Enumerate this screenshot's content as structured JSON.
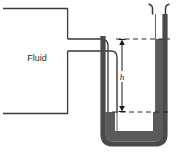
{
  "figure": {
    "type": "diagram",
    "width": 180,
    "height": 152,
    "background_color": "#ffffff"
  },
  "labels": {
    "fluid": "Fluid",
    "height": "h"
  },
  "colors": {
    "outline": "#3a3a3a",
    "manometer_wall": "#4a4a4a",
    "manometer_liquid": "#5a5a5a",
    "dashed_line": "#2b2b2b",
    "text": "#2b2b2b",
    "background": "#ffffff"
  },
  "reservoir": {
    "name": "Fluid reservoir",
    "label": "Fluid",
    "top_y": 8,
    "bottom_y": 113,
    "right_x": 68,
    "label_x": 37,
    "label_y": 58
  },
  "connecting_pipe": {
    "name": "Connecting pipe",
    "upper_wall_y": 39,
    "lower_wall_y": 51,
    "start_x": 68,
    "bend_x": 108
  },
  "manometer": {
    "name": "U-tube manometer",
    "left_limb_x": 108,
    "right_limb_x": 160,
    "bottom_y": 144,
    "top_y": 8,
    "liquid_level_left_y": 112,
    "liquid_level_right_y": 39
  },
  "dimension": {
    "name": "height-difference",
    "label": "h",
    "top_y": 39,
    "bottom_y": 112,
    "arrow_x": 122,
    "label_x": 122,
    "label_y": 77,
    "dash_top_from_x": 116,
    "dash_top_to_x": 170,
    "dash_bottom_from_x": 112,
    "dash_bottom_to_x": 170
  }
}
